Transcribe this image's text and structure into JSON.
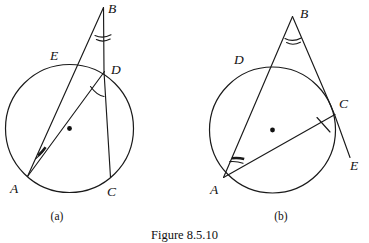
{
  "figure": {
    "caption": "Figure 8.5.10",
    "panels": [
      {
        "id": "a",
        "sublabel": "(a)",
        "point_labels": {
          "A": "A",
          "B": "B",
          "C": "C",
          "D": "D",
          "E": "E"
        }
      },
      {
        "id": "b",
        "sublabel": "(b)",
        "point_labels": {
          "A": "A",
          "B": "B",
          "C": "C",
          "D": "D",
          "E": "E"
        }
      }
    ]
  },
  "colors": {
    "ink": "#1a1a1a",
    "background": "#ffffff"
  }
}
